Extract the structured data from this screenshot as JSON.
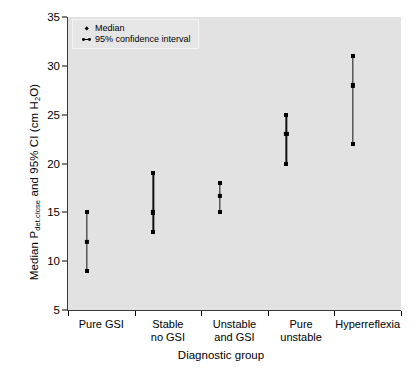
{
  "chart_data": {
    "type": "scatter",
    "title": "",
    "xlabel": "Diagnostic group",
    "ylabel_plain": "Median Pdet.close and 95% CI (cm H2O)",
    "ylabel_parts": {
      "pre": "Median P",
      "sub": "det.close",
      "mid": " and 95% CI (cm H",
      "sub2": "2",
      "post": "O)"
    },
    "ylim": [
      5,
      35
    ],
    "yticks": [
      5,
      10,
      15,
      20,
      25,
      30,
      35
    ],
    "ytick_labels": [
      "5",
      "10",
      "15",
      "20",
      "25",
      "30",
      "35"
    ],
    "grid": false,
    "legend_position": "top-left",
    "categories": [
      "Pure GSI",
      "Stable no GSI",
      "Unstable and GSI",
      "Pure unstable",
      "Hyperreflexia"
    ],
    "category_label_lines": [
      [
        "Pure GSI"
      ],
      [
        "Stable",
        "no GSI"
      ],
      [
        "Unstable",
        "and GSI"
      ],
      [
        "Pure",
        "unstable"
      ],
      [
        "Hyperreflexia"
      ]
    ],
    "series": [
      {
        "name": "Median",
        "marker": "diamond",
        "values": [
          12,
          15,
          16.7,
          23,
          28
        ]
      },
      {
        "name": "95% confidence interval",
        "marker": "dot-line-dot",
        "lower": [
          9,
          13,
          15,
          20,
          22
        ],
        "upper": [
          15,
          19,
          18,
          25,
          31
        ]
      }
    ],
    "points": [
      {
        "category": "Pure GSI",
        "median": 12,
        "ci_lower": 9,
        "ci_upper": 15
      },
      {
        "category": "Stable no GSI",
        "median": 15,
        "ci_lower": 13,
        "ci_upper": 19
      },
      {
        "category": "Unstable and GSI",
        "median": 16.7,
        "ci_lower": 15,
        "ci_upper": 18
      },
      {
        "category": "Pure unstable",
        "median": 23,
        "ci_lower": 20,
        "ci_upper": 25
      },
      {
        "category": "Hyperreflexia",
        "median": 28,
        "ci_lower": 22,
        "ci_upper": 31
      }
    ]
  },
  "legend": {
    "items": [
      {
        "label": "Median",
        "key": "diamond-marker-icon"
      },
      {
        "label": "95% confidence interval",
        "key": "interval-bar-icon"
      }
    ]
  },
  "colors": {
    "panel_background": "#e2e2e2",
    "figure_background": "#ffffff",
    "marker": "#000000",
    "axis": "#3a3a3a",
    "legend_background": "#e6e6e6",
    "legend_border": "#f4f4f4"
  }
}
